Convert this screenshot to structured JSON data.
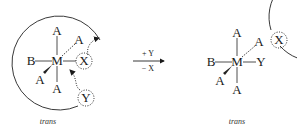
{
  "left_complex": {
    "center": "M",
    "ligands": {
      "top": "A",
      "upper_right": "A",
      "left": "B",
      "right": "X",
      "lower_left": "A",
      "bottom": "A"
    },
    "entering": "Y",
    "caption": "trans"
  },
  "arrow": {
    "above": "+ Y",
    "below": "− X"
  },
  "right_complex": {
    "center": "M",
    "ligands": {
      "top": "A",
      "upper_right": "A",
      "left": "B",
      "right": "Y",
      "lower_left": "A",
      "bottom": "A"
    },
    "leaving": "X",
    "caption": "trans"
  }
}
